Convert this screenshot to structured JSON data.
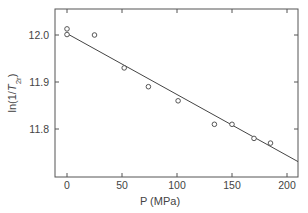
{
  "chart_data": {
    "type": "scatter",
    "title": "",
    "xlabel": "P (MPa)",
    "ylabel": "ln(1/T2r)",
    "ylabel_parts": {
      "prefix": "ln(1/",
      "italic": "T",
      "sub": "2r",
      "suffix": ")"
    },
    "xlim": [
      -7,
      212
    ],
    "ylim": [
      11.69,
      12.058
    ],
    "xticks": [
      0,
      50,
      100,
      150,
      200
    ],
    "yticks": [
      11.8,
      11.9,
      12.0
    ],
    "xtick_labels": [
      "0",
      "50",
      "100",
      "150",
      "200"
    ],
    "ytick_labels": [
      "11.8",
      "11.9",
      "12.0"
    ],
    "grid": false,
    "legend": null,
    "series": [
      {
        "name": "data",
        "marker": "open-circle",
        "x": [
          0,
          0,
          25,
          52,
          74,
          101,
          134,
          150,
          170,
          185
        ],
        "y": [
          12.013,
          12.001,
          12.0,
          11.93,
          11.89,
          11.86,
          11.81,
          11.81,
          11.78,
          11.77
        ]
      },
      {
        "name": "linear fit",
        "line": "solid",
        "x": [
          0,
          212
        ],
        "y": [
          12.003,
          11.728
        ]
      }
    ]
  }
}
